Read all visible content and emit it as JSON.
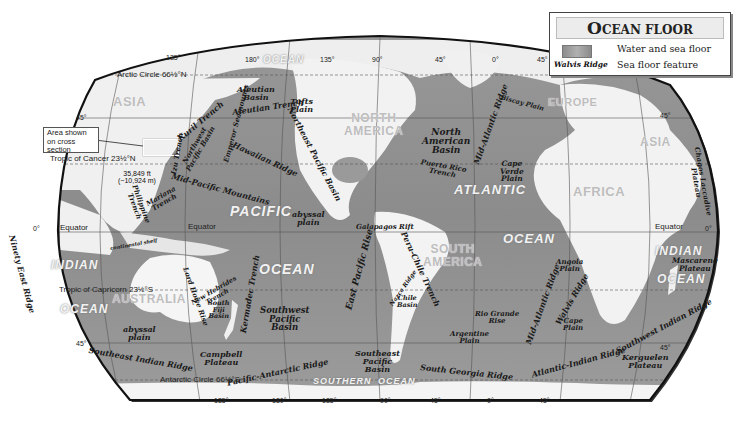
{
  "legend": {
    "title_first_letter": "O",
    "title_rest": "CEAN FLOOR",
    "items": [
      {
        "swatch": "water-sea-floor-swatch",
        "label": "Water and sea floor"
      },
      {
        "sample": "Walvis Ridge",
        "label": "Sea floor feature"
      }
    ]
  },
  "callout": {
    "text": "Area shown on cross section"
  },
  "reference_lines": {
    "arctic_circle": "Arctic Circle 66½°N",
    "tropic_cancer": "Tropic of Cancer 23½°N",
    "equator_left": "Equator",
    "equator_mid": "Equator",
    "equator_right": "Equator",
    "tropic_capricorn": "Tropic of Capricorn 23½°S",
    "antarctic_circle": "Antarctic Circle 66½°S"
  },
  "degrees": {
    "top": [
      "135°",
      "180°",
      "135°",
      "90°",
      "45°",
      "0°",
      "45°"
    ],
    "bottom": [
      "135°",
      "180°",
      "135°",
      "90°",
      "45°",
      "0°",
      "45°"
    ],
    "left_45n": "45°",
    "left_0": "0°",
    "left_45s": "45°",
    "right_45n": "45°",
    "right_0": "0°",
    "right_45s": "45°"
  },
  "continents": {
    "asia": "ASIA",
    "asia_east": "ASIA",
    "north_america": [
      "NORTH",
      "AMERICA"
    ],
    "south_america": [
      "SOUTH",
      "AMERICA"
    ],
    "europe": "EUROPE",
    "africa": "AFRICA",
    "australia": "AUSTRALIA"
  },
  "oceans": {
    "arctic": "OCEAN",
    "pacific": "PACIFIC",
    "pacific_ocean": "OCEAN",
    "atlantic": "ATLANTIC",
    "atlantic_ocean": "OCEAN",
    "indian_west": "INDIAN",
    "indian_west_ocean": "OCEAN",
    "indian_east": "INDIAN",
    "indian_east_ocean": "OCEAN",
    "southern": "SOUTHERN",
    "southern_ocean": "OCEAN"
  },
  "depth_marker": {
    "ft": "35,849 ft",
    "m": "(−10,924 m)"
  },
  "features": [
    {
      "id": "aleutian-basin",
      "lines": [
        "Aleutian",
        "Basin"
      ]
    },
    {
      "id": "aleutian-trench",
      "lines": [
        "Aleutian Trench"
      ]
    },
    {
      "id": "tufts-plain",
      "lines": [
        "Tufts",
        "Plain"
      ]
    },
    {
      "id": "kuril-trench",
      "lines": [
        "Kuril Trench"
      ]
    },
    {
      "id": "northwest-pacific-basin",
      "lines": [
        "Northwest",
        "Pacific Basin"
      ]
    },
    {
      "id": "emperor-seamounts",
      "lines": [
        "Emperor Seamounts"
      ]
    },
    {
      "id": "izu-trench",
      "lines": [
        "Izu Trench"
      ]
    },
    {
      "id": "hawaiian-ridge",
      "lines": [
        "Hawaiian Ridge"
      ]
    },
    {
      "id": "northeast-pacific-basin",
      "lines": [
        "Northeast Pacific Basin"
      ]
    },
    {
      "id": "mid-pacific-mountains",
      "lines": [
        "Mid-Pacific Mountains"
      ]
    },
    {
      "id": "philippine-trench",
      "lines": [
        "Philippine",
        "Trench"
      ]
    },
    {
      "id": "mariana-trench",
      "lines": [
        "Mariana",
        "Trench"
      ]
    },
    {
      "id": "abyssal-plain-pacific",
      "lines": [
        "abyssal",
        "plain"
      ]
    },
    {
      "id": "galapagos-rift",
      "lines": [
        "Galapagos Rift"
      ]
    },
    {
      "id": "east-pacific-rise",
      "lines": [
        "East Pacific Rise"
      ]
    },
    {
      "id": "peru-chile-trench",
      "lines": [
        "Peru-Chile Trench"
      ]
    },
    {
      "id": "nazca-ridge",
      "lines": [
        "Nazca Ridge"
      ]
    },
    {
      "id": "chile-basin",
      "lines": [
        "Chile",
        "Basin"
      ]
    },
    {
      "id": "north-american-basin",
      "lines": [
        "North",
        "American",
        "Basin"
      ]
    },
    {
      "id": "puerto-rico-trench",
      "lines": [
        "Puerto Rico",
        "Trench"
      ]
    },
    {
      "id": "mid-atlantic-ridge-north",
      "lines": [
        "Mid-Atlantic Ridge"
      ]
    },
    {
      "id": "biscay-plain",
      "lines": [
        "Biscay Plain"
      ]
    },
    {
      "id": "cape-verde-plain",
      "lines": [
        "Cape",
        "Verde",
        "Plain"
      ]
    },
    {
      "id": "ninety-east-ridge",
      "lines": [
        "Ninety East Ridge"
      ]
    },
    {
      "id": "lord-howe-rise",
      "lines": [
        "Lord Howe Rise"
      ]
    },
    {
      "id": "new-hebrides-trench",
      "lines": [
        "New Hebrides",
        "Trench"
      ]
    },
    {
      "id": "south-fiji-basin",
      "lines": [
        "South",
        "Fiji",
        "Basin"
      ]
    },
    {
      "id": "kermadec-trench",
      "lines": [
        "Kermadec Trench"
      ]
    },
    {
      "id": "southwest-pacific-basin",
      "lines": [
        "Southwest",
        "Pacific",
        "Basin"
      ]
    },
    {
      "id": "abyssal-plain-australia",
      "lines": [
        "abyssal",
        "plain"
      ]
    },
    {
      "id": "southeast-indian-ridge",
      "lines": [
        "Southeast Indian Ridge"
      ]
    },
    {
      "id": "campbell-plateau",
      "lines": [
        "Campbell",
        "Plateau"
      ]
    },
    {
      "id": "pacific-antarctic-ridge",
      "lines": [
        "Pacific-Antarctic Ridge"
      ]
    },
    {
      "id": "southeast-pacific-basin",
      "lines": [
        "Southeast",
        "Pacific",
        "Basin"
      ]
    },
    {
      "id": "south-georgia-ridge",
      "lines": [
        "South Georgia Ridge"
      ]
    },
    {
      "id": "rio-grande-rise",
      "lines": [
        "Rio Grande",
        "Rise"
      ]
    },
    {
      "id": "argentine-plain",
      "lines": [
        "Argentine",
        "Plain"
      ]
    },
    {
      "id": "mid-atlantic-ridge-south",
      "lines": [
        "Mid-Atlantic Ridge"
      ]
    },
    {
      "id": "angola-plain",
      "lines": [
        "Angola",
        "Plain"
      ]
    },
    {
      "id": "walvis-ridge",
      "lines": [
        "Walvis Ridge"
      ]
    },
    {
      "id": "cape-plain",
      "lines": [
        "Cape",
        "Plain"
      ]
    },
    {
      "id": "atlantic-indian-ridge",
      "lines": [
        "Atlantic-Indian Ridge"
      ]
    },
    {
      "id": "southwest-indian-ridge",
      "lines": [
        "Southwest Indian Ridge"
      ]
    },
    {
      "id": "kerguelen-plateau",
      "lines": [
        "Kerguelen",
        "Plateau"
      ]
    },
    {
      "id": "mascarene-plateau",
      "lines": [
        "Mascarene",
        "Plateau"
      ]
    },
    {
      "id": "chagos-laccadive-plateau",
      "lines": [
        "Chagos Laccadive",
        "Plateau"
      ]
    },
    {
      "id": "continental-shelf",
      "lines": [
        "continental shelf"
      ]
    }
  ],
  "colors": {
    "ocean_deep": "#8a8a8a",
    "ocean_shallow": "#b5b5b5",
    "land": "#f4f4f4",
    "land_relief": "#d6d6d6",
    "outline": "#111111",
    "grid": "#555555"
  }
}
